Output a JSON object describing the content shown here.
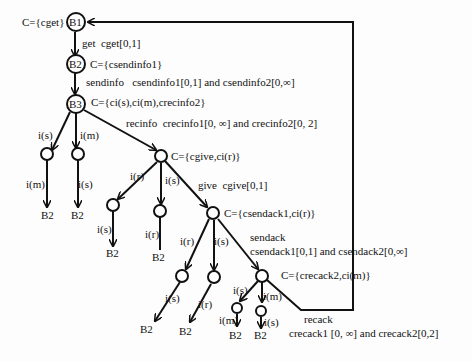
{
  "diagram": {
    "type": "state-tree",
    "nodes": {
      "b1": {
        "label": "B1",
        "constraint": "C={cget}"
      },
      "b2": {
        "label": "B2",
        "constraint": "C={csendinfo1}"
      },
      "b3": {
        "label": "B3",
        "constraint": "C={ci(s),ci(m),crecinfo2}"
      },
      "give_node": {
        "constraint": "C={cgive,ci(r)}"
      },
      "sendack_node": {
        "constraint": "C={csendack1,ci(r)}"
      },
      "recack_node": {
        "constraint": "C={crecack2,ci(m)}"
      }
    },
    "edges": {
      "get": {
        "action": "get",
        "clock": "cget[0,1]"
      },
      "sendinfo": {
        "action": "sendinfo",
        "clock": "csendinfo1[0,1] and csendinfo2[0,∞]"
      },
      "recinfo": {
        "action": "recinfo",
        "clock": "crecinfo1[0, ∞] and crecinfo2[0, 2]"
      },
      "give": {
        "action": "give",
        "clock": "cgive[0,1]"
      },
      "sendack_action": "sendack",
      "sendack_clock": "csendack1[0,1] and csendack2[0,∞]",
      "recack_action": "recack",
      "recack_clock": "crecack1 [0, ∞] and crecack2[0,2]"
    },
    "input_labels": {
      "is": "i(s)",
      "im": "i(m)",
      "ir": "i(r)"
    },
    "terminal": "B2",
    "colors": {
      "line": "#111111",
      "background": "#fdfdfd"
    }
  }
}
